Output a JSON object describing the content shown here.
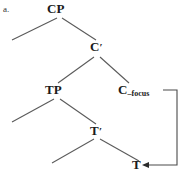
{
  "figure": {
    "example_letter": "a.",
    "type": "syntax-tree"
  },
  "nodes": {
    "cp": {
      "label": "CP"
    },
    "cbar": {
      "label": "C",
      "prime": "′"
    },
    "tp": {
      "label": "TP"
    },
    "cfocus": {
      "label": "C",
      "feature": "–focus"
    },
    "tbar": {
      "label": "T",
      "prime": "′"
    },
    "t": {
      "label": "T"
    }
  },
  "movement": {
    "from": "C–focus",
    "to": "T",
    "description": "head movement arrow from T to C"
  },
  "colors": {
    "ink": "#1b1b1b",
    "line": "#555555",
    "background": "#ffffff"
  }
}
